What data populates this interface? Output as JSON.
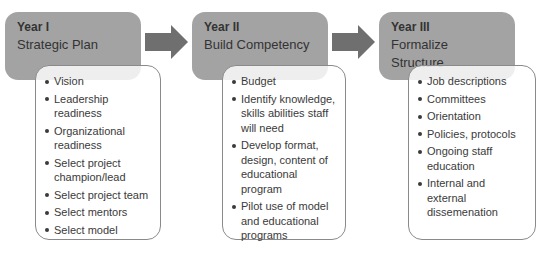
{
  "colors": {
    "header_fill": "#a3a3a3",
    "arrow_fill": "#6f6f6f",
    "list_border": "#8a8a8a",
    "text": "#3a3a3a"
  },
  "stages": [
    {
      "year": "Year I",
      "title": "Strategic Plan",
      "items": [
        "Vision",
        "Leadership readiness",
        "Organizational readiness",
        "Select project champion/lead",
        "Select project team",
        "Select mentors",
        "Select model"
      ]
    },
    {
      "year": "Year II",
      "title": "Build Competency",
      "items": [
        "Budget",
        "Identify knowledge, skills abilities staff will need",
        "Develop format, design, content of educational program",
        "Pilot use of model and educational programs"
      ]
    },
    {
      "year": "Year III",
      "title": "Formalize Structure",
      "items": [
        "Job descriptions",
        "Committees",
        "Orientation",
        "Policies, protocols",
        "Ongoing staff education",
        "Internal and external dissemenation"
      ]
    }
  ],
  "arrows": [
    {
      "from": "Year I",
      "to": "Year II",
      "icon": "right-arrow-icon"
    },
    {
      "from": "Year II",
      "to": "Year III",
      "icon": "right-arrow-icon"
    }
  ]
}
